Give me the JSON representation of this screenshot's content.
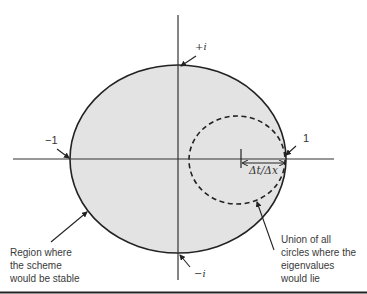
{
  "diagram": {
    "type": "complex-plane stability region",
    "colors": {
      "stable_region_fill": "#e3e3e3",
      "outline": "#222222",
      "axes": "#333333",
      "text": "#333333",
      "background": "#ffffff"
    },
    "axis_labels": {
      "plus_i": "+i",
      "minus_i": "−i",
      "minus_one": "−1",
      "one": "1"
    },
    "radius_label": "Δt/Δx",
    "annotations": {
      "stable_region": [
        "Region where",
        "the scheme",
        "would be stable"
      ],
      "eigenvalue_circles": [
        "Union of all",
        "circles where the",
        "eigenvalues",
        "would lie"
      ]
    },
    "shapes": {
      "stable_region": "solid ellipse centered at origin, radius 1",
      "eigenvalue_region": "dashed circle centered on real axis at 1 − Δt/Δx with radius Δt/Δx"
    }
  }
}
